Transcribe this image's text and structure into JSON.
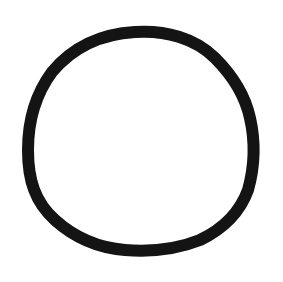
{
  "drawing": {
    "shape": "hand-drawn circle",
    "stroke_color": "#141414",
    "background_color": "#ffffff"
  }
}
